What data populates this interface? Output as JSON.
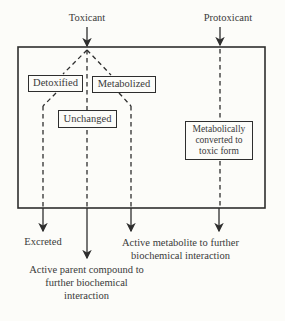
{
  "title_note": "Toxicant metabolism flow diagram",
  "colors": {
    "line": "#2e2e2e",
    "text": "#3a3a3a",
    "background": "#fcfcf9"
  },
  "inputs": {
    "toxicant": "Toxicant",
    "protoxicant": "Protoxicant"
  },
  "boxes": {
    "detoxified": "Detoxified",
    "metabolized": "Metabolized",
    "unchanged": "Unchanged",
    "metabolically_converted": "Metabolically converted to toxic form"
  },
  "outputs": {
    "excreted": "Excreted",
    "active_parent": "Active parent compound to further biochemical interaction",
    "active_metabolite": "Active metabolite to further biochemical interaction"
  }
}
